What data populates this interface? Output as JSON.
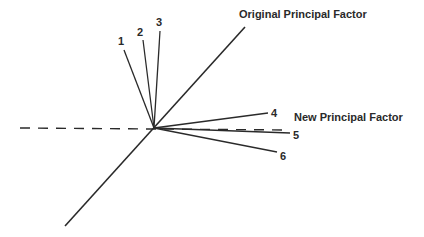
{
  "diagram": {
    "type": "factor-rotation",
    "origin": [
      154,
      128
    ],
    "axes": {
      "original": {
        "label": "Original Principal Factor",
        "start": [
          65,
          226
        ],
        "end": [
          245,
          27
        ],
        "style": "solid"
      },
      "new": {
        "label": "New Principal Factor",
        "start": [
          20,
          128
        ],
        "end": [
          290,
          130
        ],
        "style": "dashed"
      }
    },
    "vectors": [
      {
        "id": "1",
        "end": [
          124,
          50
        ],
        "label_pos": [
          122,
          44
        ]
      },
      {
        "id": "2",
        "end": [
          143,
          40
        ],
        "label_pos": [
          141,
          35
        ]
      },
      {
        "id": "3",
        "end": [
          160,
          31
        ],
        "label_pos": [
          160,
          25
        ]
      },
      {
        "id": "4",
        "end": [
          268,
          113
        ],
        "label_pos": [
          275,
          117
        ]
      },
      {
        "id": "5",
        "end": [
          290,
          133
        ],
        "label_pos": [
          297,
          139
        ]
      },
      {
        "id": "6",
        "end": [
          277,
          152
        ],
        "label_pos": [
          283,
          160
        ]
      }
    ],
    "colors": {
      "line": "#2a2a2a",
      "text": "#2a2a2a",
      "background": "#ffffff"
    }
  }
}
